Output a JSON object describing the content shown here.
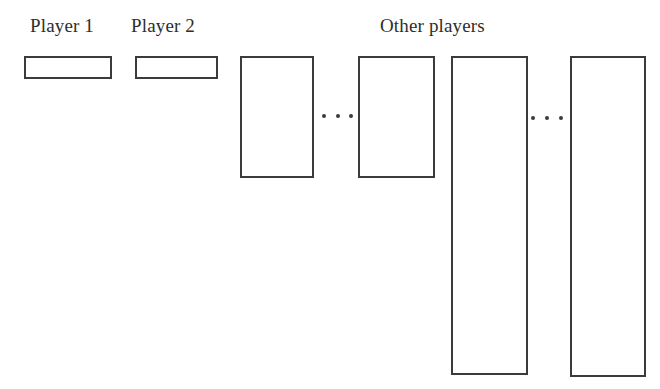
{
  "figure": {
    "title": "",
    "background_color": "#ffffff",
    "stroke_color": "#3b3b3b",
    "fill_color": "#ffffff",
    "labels": [
      {
        "id": "player-1",
        "text": "Player 1",
        "x": 30,
        "y": 16,
        "width": 83
      },
      {
        "id": "player-2",
        "text": "Player 2",
        "x": 131,
        "y": 16,
        "width": 88
      },
      {
        "id": "other-players",
        "text": "Other players",
        "x": 380,
        "y": 16,
        "width": 142
      }
    ],
    "bars": [
      {
        "id": "bar-player-1",
        "x": 24,
        "y": 56,
        "width": 88,
        "height": 23
      },
      {
        "id": "bar-player-2",
        "x": 135,
        "y": 56,
        "width": 83,
        "height": 23
      },
      {
        "id": "bar-other-1",
        "x": 240,
        "y": 56,
        "width": 74,
        "height": 122
      },
      {
        "id": "bar-other-2",
        "x": 358,
        "y": 56,
        "width": 77,
        "height": 122
      },
      {
        "id": "bar-other-3",
        "x": 451,
        "y": 56,
        "width": 77,
        "height": 319
      },
      {
        "id": "bar-other-4",
        "x": 570,
        "y": 56,
        "width": 76,
        "height": 321
      }
    ],
    "ellipses": [
      {
        "id": "ellipsis-1",
        "x": 322,
        "y": 113,
        "width": 31,
        "dots": 3
      },
      {
        "id": "ellipsis-2",
        "x": 531,
        "y": 115,
        "width": 32,
        "dots": 3
      }
    ]
  }
}
